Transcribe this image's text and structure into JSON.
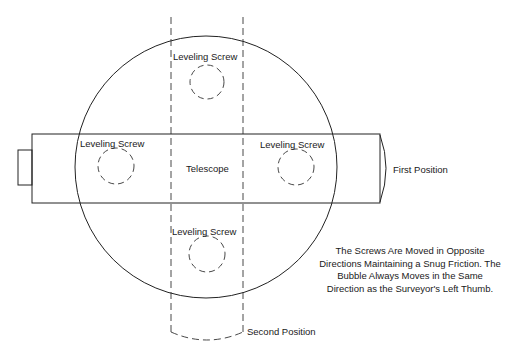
{
  "labels": {
    "top_screw": "Leveling Screw",
    "left_screw": "Leveling Screw",
    "right_screw": "Leveling Screw",
    "bottom_screw": "Leveling Screw",
    "telescope": "Telescope",
    "first_position": "First Position",
    "second_position": "Second Position"
  },
  "note": {
    "text": "The Screws Are Moved in Opposite Directions Maintaining a Snug Friction.  The Bubble Always Moves in the Same Direction as the Surveyor's Left Thumb."
  },
  "colors": {
    "line": "#222222",
    "background": "#ffffff"
  }
}
